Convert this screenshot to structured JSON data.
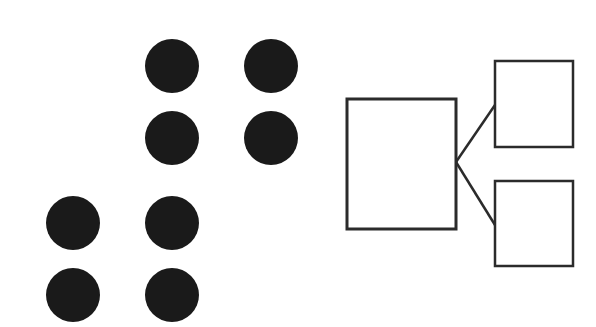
{
  "diagram": {
    "background": "#ffffff",
    "dot_color": "#1a1a1a",
    "stroke_color": "#2b2b2b",
    "dot_radius": 27,
    "dot_groups": [
      {
        "name": "upper-right-group",
        "dots": [
          {
            "cx": 172,
            "cy": 66
          },
          {
            "cx": 271,
            "cy": 66
          },
          {
            "cx": 172,
            "cy": 138
          },
          {
            "cx": 271,
            "cy": 138
          }
        ]
      },
      {
        "name": "lower-left-group",
        "dots": [
          {
            "cx": 73,
            "cy": 223
          },
          {
            "cx": 172,
            "cy": 223
          },
          {
            "cx": 73,
            "cy": 295
          },
          {
            "cx": 172,
            "cy": 295
          }
        ]
      }
    ],
    "boxes": [
      {
        "name": "parent-box",
        "x": 347,
        "y": 99,
        "w": 109,
        "h": 130,
        "stroke_width": 3
      },
      {
        "name": "child-box-top",
        "x": 495,
        "y": 61,
        "w": 78,
        "h": 86,
        "stroke_width": 2.5
      },
      {
        "name": "child-box-bottom",
        "x": 495,
        "y": 181,
        "w": 78,
        "h": 85,
        "stroke_width": 2.5
      }
    ],
    "connectors": [
      {
        "name": "connector-top",
        "x1": 456,
        "y1": 162,
        "x2": 495,
        "y2": 105
      },
      {
        "name": "connector-bottom",
        "x1": 456,
        "y1": 162,
        "x2": 495,
        "y2": 225
      }
    ]
  }
}
